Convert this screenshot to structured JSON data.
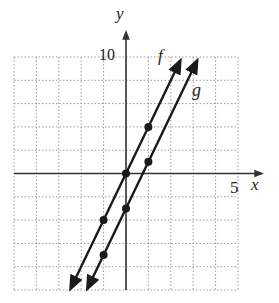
{
  "chart_data": {
    "type": "line",
    "title": "",
    "xlabel": "x",
    "ylabel": "y",
    "xlim": [
      -5,
      5
    ],
    "ylim": [
      -10,
      10
    ],
    "x_tick_label": "5",
    "y_tick_label": "10",
    "grid": true,
    "grid_style": "dotted",
    "x_cell_units": 1,
    "y_cell_units": 2,
    "legend_position": "inline labels near top-right of each line",
    "series": [
      {
        "name": "f",
        "equation": "y = 4x",
        "slope": 4,
        "intercept": 0,
        "points": [
          [
            -1,
            -4
          ],
          [
            0,
            0
          ],
          [
            1,
            4
          ]
        ]
      },
      {
        "name": "g",
        "equation": "y = 4x - 3",
        "slope": 4,
        "intercept": -3,
        "points": [
          [
            -1,
            -7
          ],
          [
            0,
            -3
          ],
          [
            1,
            1
          ]
        ]
      }
    ]
  },
  "labels": {
    "y_axis": "y",
    "x_axis": "x",
    "y_tick": "10",
    "x_tick": "5",
    "f": "f",
    "g": "g"
  },
  "colors": {
    "line": "#1a1a1a",
    "grid": "#9a9a9a",
    "axis": "#333333"
  }
}
